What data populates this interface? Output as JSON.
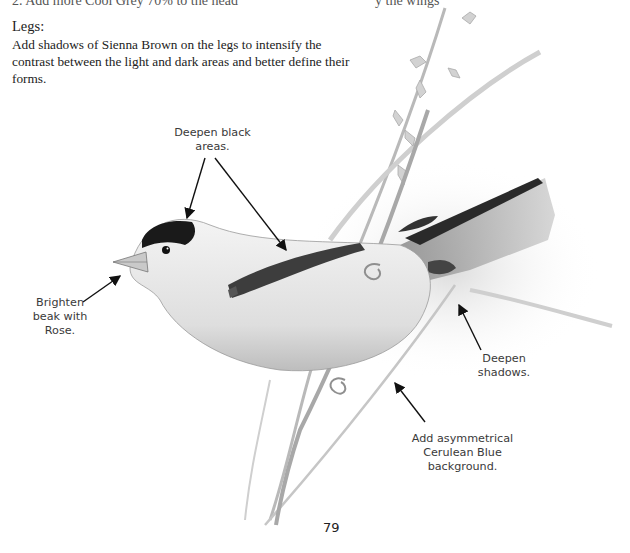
{
  "page": {
    "top_fragment_left": "2. Add more Cool Grey 70% to the head",
    "top_fragment_right": "y the wings",
    "section_heading": "Legs:",
    "section_text": "Add shadows of Sienna Brown on the legs to intensify the contrast between the light and dark areas and better define their forms.",
    "page_number": "79"
  },
  "illustration": {
    "subject": "Goldfinch perched on grass stem (pencil drawing)",
    "callouts": [
      {
        "id": "deepen-black",
        "lines": [
          "Deepen black",
          "areas."
        ]
      },
      {
        "id": "brighten-beak",
        "lines": [
          "Brighten",
          "beak with",
          "Rose."
        ]
      },
      {
        "id": "deepen-shadows",
        "lines": [
          "Deepen",
          "shadows."
        ]
      },
      {
        "id": "cerulean-background",
        "lines": [
          "Add asymmetrical",
          "Cerulean Blue",
          "background."
        ]
      }
    ]
  },
  "colors": {
    "ink": "#222222",
    "callout_text": "#3a3a3a",
    "arrow": "#111111",
    "cap_black": "#1a1a1a",
    "pencil_grey": "#9a9a9a"
  }
}
